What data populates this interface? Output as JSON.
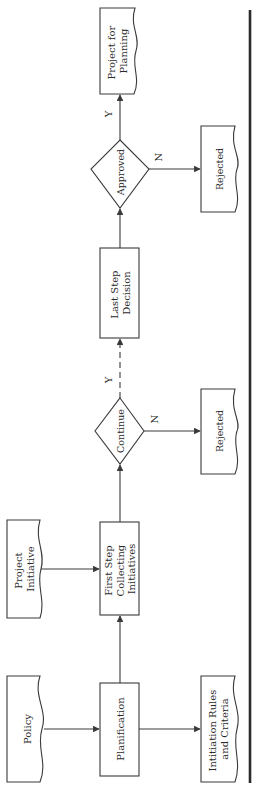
{
  "diagram": {
    "type": "flowchart",
    "orientation": "rotated-90-ccw",
    "colors": {
      "stroke": "#3a3a3a",
      "text": "#2a2a2a",
      "background": "#ffffff",
      "rule": "#2b2b2b"
    },
    "nodes": {
      "policy": {
        "shape": "document",
        "lines": [
          "Policy"
        ]
      },
      "planification": {
        "shape": "process",
        "lines": [
          "Planification"
        ]
      },
      "initiation_rules": {
        "shape": "document",
        "lines": [
          "Intitiation Rules",
          "and Criteria"
        ]
      },
      "project_initiative": {
        "shape": "document",
        "lines": [
          "Project",
          "Initiative"
        ]
      },
      "first_step": {
        "shape": "process",
        "lines": [
          "First Step",
          "Collecting",
          "Initiatives"
        ]
      },
      "continue": {
        "shape": "decision",
        "lines": [
          "Continue"
        ]
      },
      "rejected_1": {
        "shape": "document",
        "lines": [
          "Rejected"
        ]
      },
      "last_step": {
        "shape": "process",
        "lines": [
          "Last Step",
          "Decision"
        ]
      },
      "approved": {
        "shape": "decision",
        "lines": [
          "Approved"
        ]
      },
      "rejected_2": {
        "shape": "document",
        "lines": [
          "Rejected"
        ]
      },
      "project_for_planning": {
        "shape": "document",
        "lines": [
          "Project for",
          "Planning"
        ]
      }
    },
    "edges": [
      {
        "from": "policy",
        "to": "planification",
        "style": "solid",
        "label": ""
      },
      {
        "from": "planification",
        "to": "initiation_rules",
        "style": "solid",
        "label": ""
      },
      {
        "from": "planification",
        "to": "first_step",
        "style": "solid",
        "label": ""
      },
      {
        "from": "project_initiative",
        "to": "first_step",
        "style": "solid",
        "label": ""
      },
      {
        "from": "first_step",
        "to": "continue",
        "style": "solid",
        "label": ""
      },
      {
        "from": "continue",
        "to": "rejected_1",
        "style": "solid",
        "label": "N"
      },
      {
        "from": "continue",
        "to": "last_step",
        "style": "dashed",
        "label": "Y"
      },
      {
        "from": "last_step",
        "to": "approved",
        "style": "solid",
        "label": ""
      },
      {
        "from": "approved",
        "to": "rejected_2",
        "style": "solid",
        "label": "N"
      },
      {
        "from": "approved",
        "to": "project_for_planning",
        "style": "solid",
        "label": "Y"
      }
    ],
    "edge_labels": {
      "continue_no": "N",
      "continue_yes": "Y",
      "approved_no": "N",
      "approved_yes": "Y"
    }
  }
}
